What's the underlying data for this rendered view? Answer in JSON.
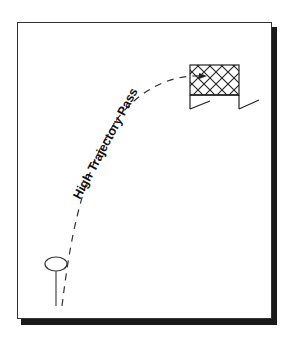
{
  "diagram": {
    "title": "High Trajectory Pass",
    "elements": {
      "player_marker": "pin-icon",
      "trajectory": "dashed-curve",
      "goal": "net-goal-icon"
    },
    "colors": {
      "stroke": "#222222",
      "shadow": "#1a1a1a",
      "background": "#ffffff"
    }
  }
}
